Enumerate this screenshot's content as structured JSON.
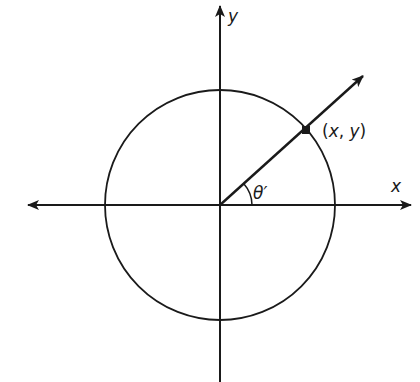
{
  "diagram": {
    "colors": {
      "stroke": "#1a1a1a",
      "background": "#ffffff"
    },
    "axes": {
      "x_label": "x",
      "y_label": "y"
    },
    "circle": {
      "cx": 220,
      "cy": 205,
      "r": 115
    },
    "ray": {
      "angle_label": "θ′",
      "angle_degrees": 41
    },
    "point": {
      "label_open": "(",
      "label_x": "x",
      "label_comma": ", ",
      "label_y": "y",
      "label_close": ")"
    }
  }
}
